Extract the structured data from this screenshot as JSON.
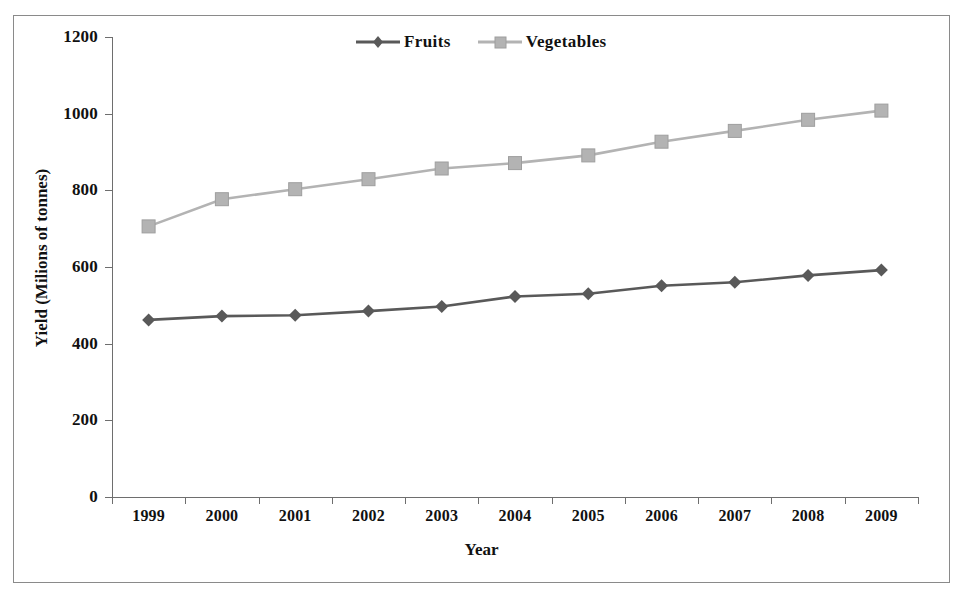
{
  "chart_data": {
    "type": "line",
    "title": "",
    "xlabel": "Year",
    "ylabel": "Yield (Milions of tonnes)",
    "categories": [
      "1999",
      "2000",
      "2001",
      "2002",
      "2003",
      "2004",
      "2005",
      "2006",
      "2007",
      "2008",
      "2009"
    ],
    "series": [
      {
        "name": "Fruits",
        "color": "#595959",
        "marker": "diamond",
        "values": [
          462,
          472,
          474,
          485,
          497,
          523,
          530,
          551,
          560,
          578,
          592
        ]
      },
      {
        "name": "Vegetables",
        "color": "#b3b3b3",
        "marker": "square",
        "values": [
          706,
          777,
          803,
          829,
          857,
          871,
          891,
          927,
          955,
          984,
          1008
        ]
      }
    ],
    "ylim": [
      0,
      1200
    ],
    "yticks": [
      0,
      200,
      400,
      600,
      800,
      1000,
      1200
    ],
    "ytick_labels": [
      "0",
      "200",
      "400",
      "600",
      "800",
      "1000",
      "1200"
    ],
    "grid": false,
    "legend_position": "top-center"
  },
  "axes": {
    "y_title": "Yield (Milions of tonnes)",
    "x_title": "Year"
  },
  "legend": {
    "entries": [
      {
        "label": "Fruits",
        "marker": "diamond-marker",
        "color": "#595959"
      },
      {
        "label": "Vegetables",
        "marker": "square-marker",
        "color": "#b3b3b3"
      }
    ]
  }
}
